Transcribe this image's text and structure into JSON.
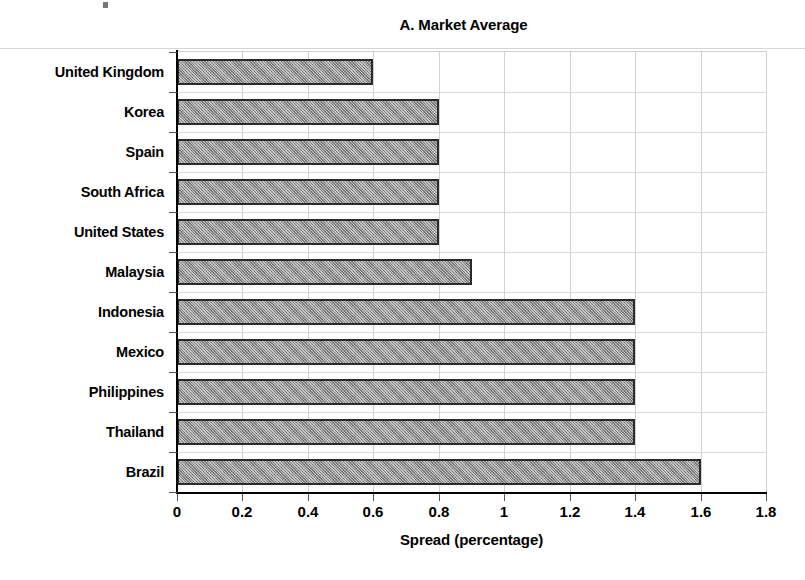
{
  "chart_data": {
    "type": "bar",
    "orientation": "horizontal",
    "title": "A. Market Average",
    "xlabel": "Spread (percentage)",
    "ylabel": "",
    "xlim": [
      0,
      1.8
    ],
    "xticks": [
      "0",
      "0.2",
      "0.4",
      "0.6",
      "0.8",
      "1",
      "1.2",
      "1.4",
      "1.6",
      "1.8"
    ],
    "xtick_values": [
      0,
      0.2,
      0.4,
      0.6,
      0.8,
      1.0,
      1.2,
      1.4,
      1.6,
      1.8
    ],
    "grid": "vertical-and-horizontal",
    "legend": "none",
    "categories": [
      "United Kingdom",
      "Korea",
      "Spain",
      "South Africa",
      "United States",
      "Malaysia",
      "Indonesia",
      "Mexico",
      "Philippines",
      "Thailand",
      "Brazil"
    ],
    "values": [
      0.6,
      0.8,
      0.8,
      0.8,
      0.8,
      0.9,
      1.4,
      1.4,
      1.4,
      1.4,
      1.6
    ],
    "bar_style": {
      "fill": "#8c8c8c",
      "pattern": "cross-hatch",
      "border": "#2b2b2b"
    }
  },
  "colors": {
    "background": "#ffffff",
    "text": "#000000",
    "grid": "#d2d2d2",
    "axis": "#000000",
    "bar_fill": "#8c8c8c",
    "bar_border": "#2b2b2b"
  }
}
